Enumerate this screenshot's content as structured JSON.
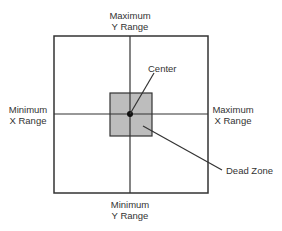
{
  "diagram": {
    "labels": {
      "max_y_line1": "Maximum",
      "max_y_line2": "Y Range",
      "min_y_line1": "Minimum",
      "min_y_line2": "Y Range",
      "min_x_line1": "Minimum",
      "min_x_line2": "X Range",
      "max_x_line1": "Maximum",
      "max_x_line2": "X Range",
      "center": "Center",
      "dead_zone": "Dead Zone"
    },
    "colors": {
      "line": "#333333",
      "dead_zone_fill": "#bdbdbd",
      "background": "#ffffff"
    }
  }
}
